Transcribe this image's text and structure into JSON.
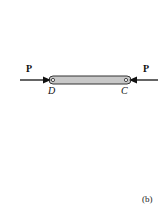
{
  "figure": {
    "caption": "(b)",
    "forces": [
      {
        "label": "P",
        "side": "left",
        "direction": "right"
      },
      {
        "label": "P",
        "side": "right",
        "direction": "left"
      }
    ],
    "points": [
      {
        "label": "D",
        "side": "left"
      },
      {
        "label": "C",
        "side": "right"
      }
    ],
    "colors": {
      "bar_fill": "#c8c8c8",
      "bar_stroke": "#333333",
      "arrow": "#111111"
    }
  }
}
